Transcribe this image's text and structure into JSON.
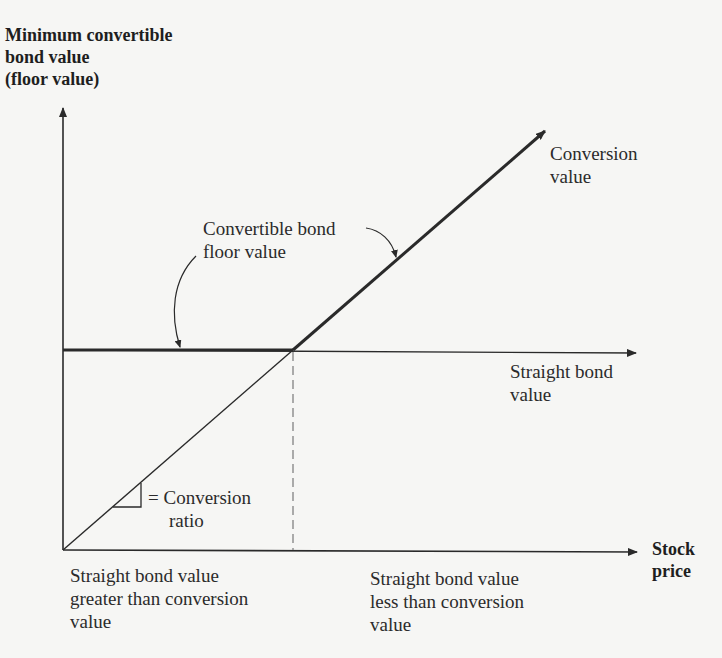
{
  "diagram": {
    "y_axis_label": [
      "Minimum convertible",
      "bond value",
      "(floor value)"
    ],
    "x_axis_label": [
      "Stock",
      "price"
    ],
    "lines": {
      "conversion_value": [
        "Conversion",
        "value"
      ],
      "straight_bond_value": [
        "Straight bond",
        "value"
      ],
      "floor_value": [
        "Convertible bond",
        "floor value"
      ]
    },
    "slope_note": [
      "= Conversion",
      "ratio"
    ],
    "regions": {
      "left": [
        "Straight bond value",
        "greater than conversion",
        "value"
      ],
      "right": [
        "Straight bond value",
        "less than conversion",
        "value"
      ]
    },
    "colors": {
      "line": "#2a2a2a",
      "dashed": "#8a8a8a",
      "background": "#f6f6f4"
    }
  }
}
